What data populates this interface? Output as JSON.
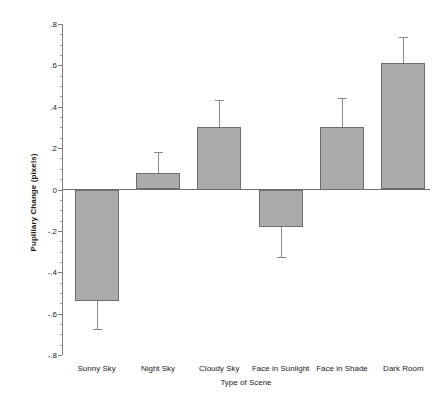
{
  "chart_data": {
    "type": "bar",
    "title": "",
    "xlabel": "Type of Scene",
    "ylabel": "Pupillary Change (pixels)",
    "categories": [
      "Sunny Sky",
      "Night Sky",
      "Cloudy Sky",
      "Face in Sunlight",
      "Face in Shade",
      "Dark Room"
    ],
    "values": [
      -0.54,
      0.08,
      0.3,
      -0.18,
      0.3,
      0.61
    ],
    "error_upper": [
      0.135,
      0.1,
      0.135,
      0.145,
      0.14,
      0.125
    ],
    "error_lower": [
      0.135,
      0.1,
      0.135,
      0.145,
      0.14,
      0.125
    ],
    "error_bar_outer": [
      -0.675,
      0.18,
      0.435,
      -0.325,
      0.44,
      0.735
    ],
    "ylim": [
      -0.8,
      0.8
    ],
    "ytick_labels": [
      ".8",
      ".6",
      ".4",
      ".2",
      "0",
      "-.2",
      "-.4",
      "-.6",
      "-.8"
    ],
    "ytick_values": [
      0.8,
      0.6,
      0.4,
      0.2,
      0.0,
      -0.2,
      -0.4,
      -0.6,
      -0.8
    ],
    "yminor_step": 0.05,
    "grid": "none",
    "legend": "none",
    "bar_color": "#ababab",
    "bar_edge_color": "#6d6d6d",
    "axis_color": "#7d7d7d",
    "error_color": "#8a8a8a"
  }
}
